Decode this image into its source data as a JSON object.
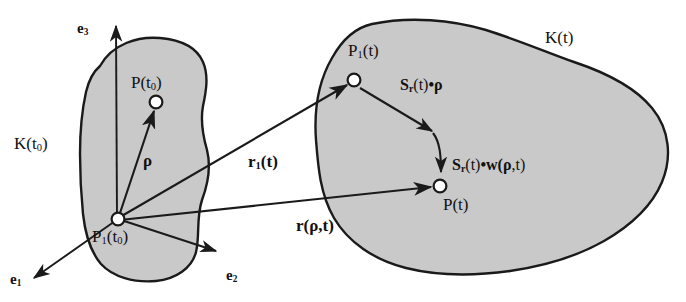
{
  "figure": {
    "type": "diagram",
    "background_color": "#ffffff",
    "body_fill_color": "#c9c9c9",
    "outline_color": "#1a1a1a",
    "arrow_color": "#1a1a1a",
    "node_fill_color": "#ffffff"
  },
  "bodies": [
    {
      "id": "reference",
      "label": "K(t",
      "label_sub": "0",
      "label_suffix": ")"
    },
    {
      "id": "current",
      "label": "K(t)",
      "label_sub": "",
      "label_suffix": ""
    }
  ],
  "labels": {
    "body_reference": "K(t",
    "body_reference_sub": "0",
    "body_reference_close": ")",
    "body_current": "K(t)",
    "basis_e1": "e",
    "basis_e1_sub": "1",
    "basis_e2": "e",
    "basis_e2_sub": "2",
    "basis_e3": "e",
    "basis_e3_sub": "3",
    "origin_point": "P",
    "origin_point_sub": "1",
    "origin_point_arg": "(t",
    "origin_point_arg_sub": "0",
    "origin_point_close": ")",
    "material_point_ref": "P(t",
    "material_point_ref_sub": "0",
    "material_point_ref_close": ")",
    "body_point_current": "P",
    "body_point_current_sub": "1",
    "body_point_current_arg": "(t)",
    "material_point_current": "P(t)",
    "vec_rho": "ρ",
    "vec_r1": "r",
    "vec_r1_sub": "1",
    "vec_r1_arg": "(t)",
    "vec_r": "r(",
    "vec_r_rho": "ρ",
    "vec_r_tail": ",t)",
    "rot_rho_S": "S",
    "rot_rho_S_sub": "r",
    "rot_rho_t": "(t)",
    "rot_rho_dot": "•",
    "rot_rho_rho": "ρ",
    "rot_w_S": "S",
    "rot_w_S_sub": "r",
    "rot_w_t": "(t)",
    "rot_w_dot": "•",
    "rot_w_w": "w(",
    "rot_w_rho": "ρ",
    "rot_w_tail": ",t)"
  },
  "geometry": {
    "origin_P1_t0": [
      118,
      219
    ],
    "point_P_t0": [
      156,
      102
    ],
    "point_P1_t": [
      354,
      80
    ],
    "point_P_t": [
      440,
      186
    ],
    "arrow_e1_tip": [
      30,
      281
    ],
    "arrow_e2_tip": [
      221,
      253
    ],
    "arrow_e3_tip": [
      116,
      22
    ]
  }
}
